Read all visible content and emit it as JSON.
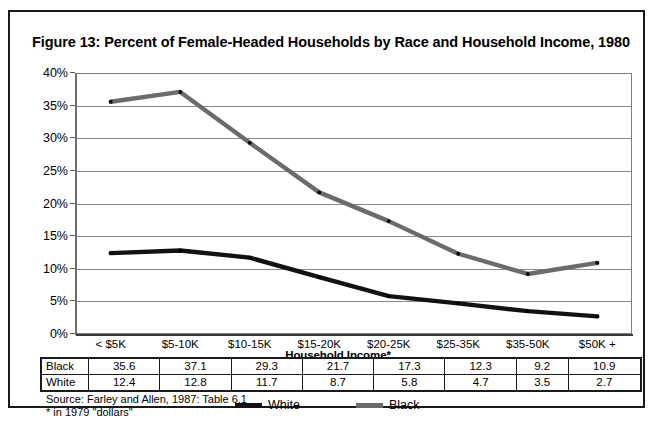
{
  "figure": {
    "title": "Figure 13:  Percent of Female-Headed Households by Race and Household Income, 1980",
    "source": "Source: Farley and Allen, 1987: Table 6.1",
    "footnote": "* in 1979 \"dollars\""
  },
  "legend": {
    "items": [
      {
        "label": "White",
        "color": "#121212"
      },
      {
        "label": "Black",
        "color": "#6b6b6b"
      }
    ]
  },
  "table": {
    "rows": [
      {
        "label": "Black",
        "values": [
          "35.6",
          "37.1",
          "29.3",
          "21.7",
          "17.3",
          "12.3",
          "9.2",
          "10.9"
        ]
      },
      {
        "label": "White",
        "values": [
          "12.4",
          "12.8",
          "11.7",
          "8.7",
          "5.8",
          "4.7",
          "3.5",
          "2.7"
        ]
      }
    ]
  },
  "chart_data": {
    "type": "line",
    "title": "Figure 13:  Percent of Female-Headed Households by Race and Household Income, 1980",
    "xlabel": "Household Income*",
    "ylabel": "",
    "categories": [
      "< $5K",
      "$5-10K",
      "$10-15K",
      "$15-20K",
      "$20-25K",
      "$25-35K",
      "$35-50K",
      "$50K +"
    ],
    "ytick_labels": [
      "40%",
      "35%",
      "30%",
      "25%",
      "20%",
      "15%",
      "10%",
      "5%",
      "0%"
    ],
    "ytick_values": [
      40,
      35,
      30,
      25,
      20,
      15,
      10,
      5,
      0
    ],
    "ylim": [
      0,
      40
    ],
    "grid": true,
    "legend_position": "bottom",
    "series": [
      {
        "name": "White",
        "color": "#121212",
        "values": [
          12.4,
          12.8,
          11.7,
          8.7,
          5.8,
          4.7,
          3.5,
          2.7
        ]
      },
      {
        "name": "Black",
        "color": "#6b6b6b",
        "values": [
          35.6,
          37.1,
          29.3,
          21.7,
          17.3,
          12.3,
          9.2,
          10.9
        ]
      }
    ]
  }
}
